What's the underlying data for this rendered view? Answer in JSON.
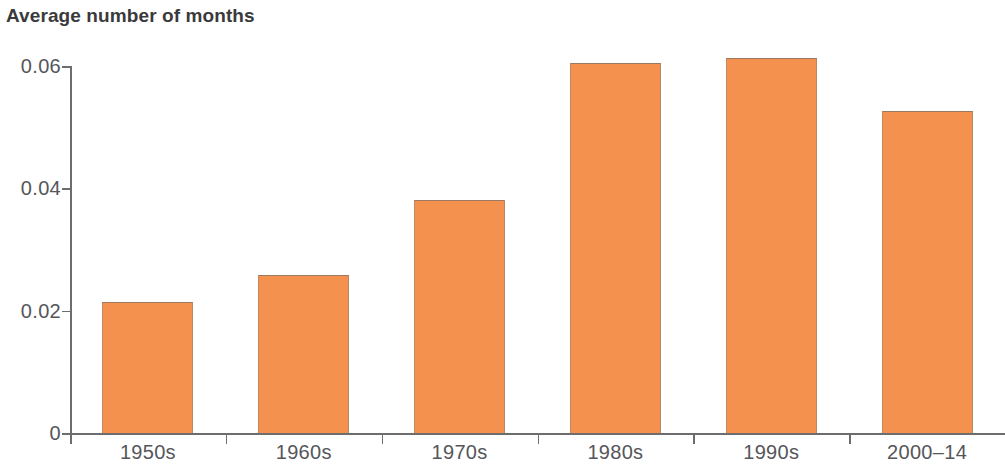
{
  "chart_data": {
    "type": "bar",
    "title": "Average number of months",
    "subtitle": "",
    "xlabel": "",
    "ylabel": "",
    "categories": [
      "1950s",
      "1960s",
      "1970s",
      "1980s",
      "1990s",
      "2000–14"
    ],
    "values": [
      0.0215,
      0.0258,
      0.0381,
      0.0605,
      0.0613,
      0.0527
    ],
    "series": [
      {
        "name": "Average number of months",
        "values": [
          0.0215,
          0.0258,
          0.0381,
          0.0605,
          0.0613,
          0.0527
        ]
      }
    ],
    "ylim": [
      0,
      0.06
    ],
    "xlim_categorical": true,
    "ytick_labels": [
      "0",
      "0.02",
      "0.04",
      "0.06"
    ],
    "ytick_values": [
      0,
      0.02,
      0.04,
      0.06
    ],
    "grid": false,
    "legend": null,
    "legend_position": "none",
    "bar_color": "#F4914E",
    "bar_edge_color": "#9c7a62",
    "axis_color": "#6d6d6d",
    "text_color": "#55565a",
    "title_color": "#3a3a3c",
    "background": "#ffffff",
    "annotations": []
  },
  "axis": {
    "y_ticks": [
      {
        "label": "0.06",
        "value": 0.06
      },
      {
        "label": "0.04",
        "value": 0.04
      },
      {
        "label": "0.02",
        "value": 0.02
      },
      {
        "label": "0",
        "value": 0
      }
    ]
  },
  "bars": [
    {
      "label": "1950s",
      "value": 0.0215
    },
    {
      "label": "1960s",
      "value": 0.0258
    },
    {
      "label": "1970s",
      "value": 0.0381
    },
    {
      "label": "1980s",
      "value": 0.0605
    },
    {
      "label": "1990s",
      "value": 0.0613
    },
    {
      "label": "2000–14",
      "value": 0.0527
    }
  ]
}
